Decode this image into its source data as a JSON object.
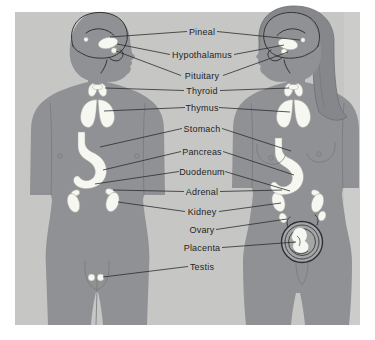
{
  "diagram": {
    "labels": [
      {
        "text": "Pineal"
      },
      {
        "text": "Hypothalamus"
      },
      {
        "text": "Pituitary"
      },
      {
        "text": "Thyroid"
      },
      {
        "text": "Thymus"
      },
      {
        "text": "Stomach"
      },
      {
        "text": "Pancreas"
      },
      {
        "text": "Duodenum"
      },
      {
        "text": "Adrenal"
      },
      {
        "text": "Kidney"
      },
      {
        "text": "Ovary"
      },
      {
        "text": "Placenta"
      },
      {
        "text": "Testis"
      }
    ],
    "figures": [
      {
        "name": "male-figure"
      },
      {
        "name": "female-figure"
      }
    ],
    "colors": {
      "page_bg": "#ffffff",
      "panel_bg": "#c6c7c5",
      "body_gray": "#8f9194",
      "hair_gray": "#85878a",
      "organ_white": "#f7f7f1",
      "leader_line": "#2c2c2c"
    }
  }
}
